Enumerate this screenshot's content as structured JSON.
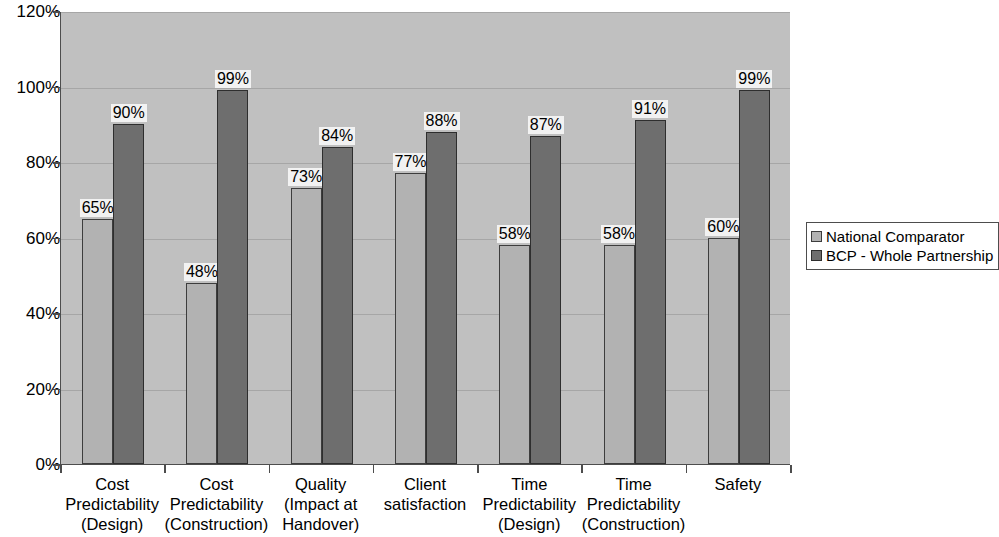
{
  "chart_data": {
    "type": "bar",
    "title": "",
    "subtitle": "",
    "xlabel": "",
    "ylabel": "",
    "ylim": [
      0,
      120
    ],
    "y_ticks": [
      "0%",
      "20%",
      "40%",
      "60%",
      "80%",
      "100%",
      "120%"
    ],
    "y_tick_values": [
      0,
      20,
      40,
      60,
      80,
      100,
      120
    ],
    "grid": true,
    "legend_position": "right",
    "categories": [
      "Cost\nPredictability\n(Design)",
      "Cost\nPredictability\n(Construction)",
      "Quality\n(Impact at\nHandover)",
      "Client\nsatisfaction",
      "Time\nPredictability\n(Design)",
      "Time\nPredictability\n(Construction)",
      "Safety"
    ],
    "series": [
      {
        "name": "National Comparator",
        "color": "#b2b2b2",
        "values": [
          65,
          48,
          73,
          77,
          58,
          58,
          60
        ],
        "labels": [
          "65%",
          "48%",
          "73%",
          "77%",
          "58%",
          "58%",
          "60%"
        ]
      },
      {
        "name": "BCP - Whole Partnership",
        "color": "#6e6e6e",
        "values": [
          90,
          99,
          84,
          88,
          87,
          91,
          99
        ],
        "labels": [
          "90%",
          "99%",
          "84%",
          "88%",
          "87%",
          "91%",
          "99%"
        ]
      }
    ],
    "plot_background": "#c0c0c0",
    "page_background": "#ffffff",
    "axis_color": "#4d4d4d",
    "gridline_color": "#a6a6a6"
  },
  "legend": {
    "entries": [
      {
        "label": "National Comparator"
      },
      {
        "label": "BCP - Whole Partnership"
      }
    ]
  }
}
